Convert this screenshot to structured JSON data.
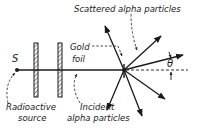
{
  "diagram": {
    "type": "physics-schematic",
    "labels": {
      "source_symbol": "S",
      "gold_foil_line1": "Gold",
      "gold_foil_line2": "foil",
      "scattered": "Scattered alpha particles",
      "source_line1": "Radioactive",
      "source_line2": "source",
      "incident_line1": "Incident",
      "incident_line2": "alpha particles",
      "angle": "θ"
    },
    "colors": {
      "ink": "#1a1a1a",
      "background": "#ffffff"
    },
    "elements": [
      {
        "name": "radioactive-source",
        "label": "S"
      },
      {
        "name": "collimator-plate-1"
      },
      {
        "name": "collimator-plate-2"
      },
      {
        "name": "incident-beam"
      },
      {
        "name": "gold-foil"
      },
      {
        "name": "scattered-rays",
        "count": 6
      },
      {
        "name": "scattering-angle",
        "label": "θ"
      }
    ]
  }
}
